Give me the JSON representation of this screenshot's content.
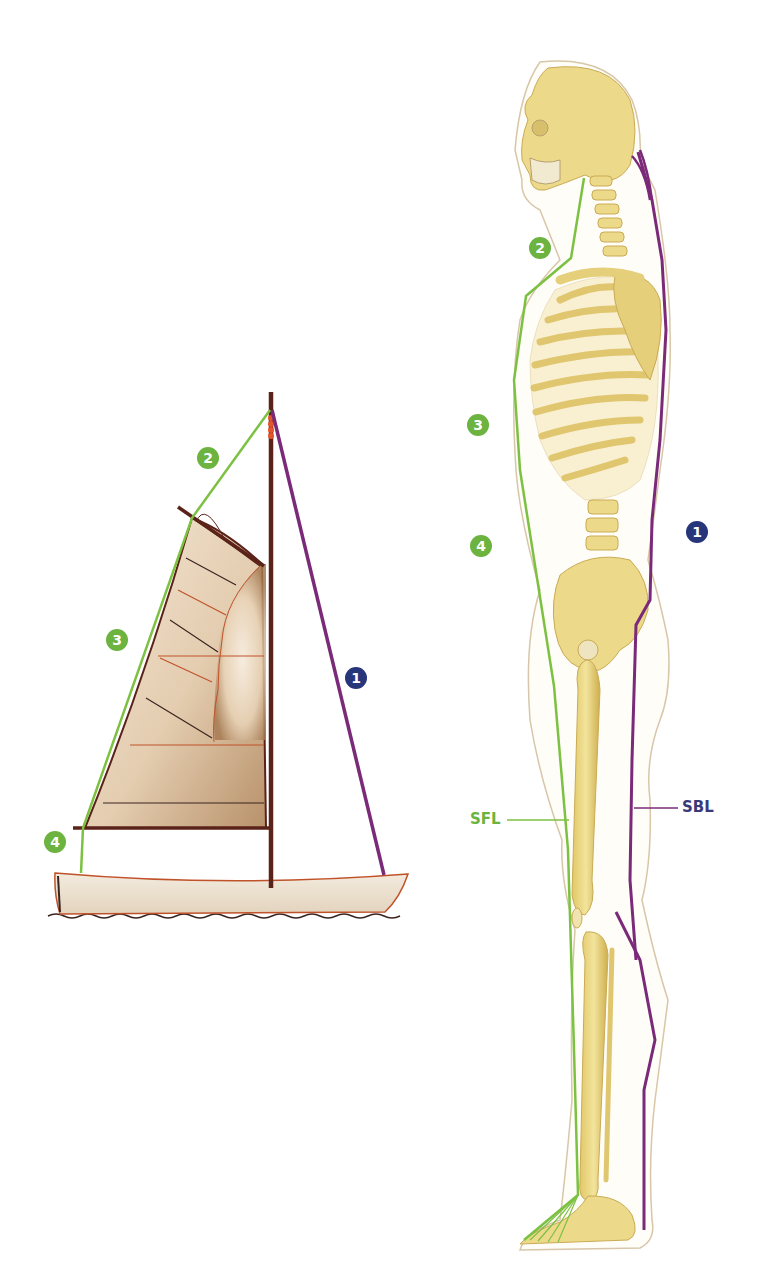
{
  "diagram": {
    "colors": {
      "sfl_green": "#7cc142",
      "sbl_purple": "#7a2a78",
      "badge_green": "#6cb33f",
      "badge_navy": "#27357a",
      "sfl_label": "#6cb33f",
      "sbl_label": "#3a3a7a",
      "mast_brown": "#5a2218",
      "bone_yellow": "#ecd98a",
      "sail_tan": "#ead9c3",
      "hull_tan": "#efe4d4",
      "hull_outline": "#c0522a"
    },
    "sailboat": {
      "badges": [
        {
          "id": "1",
          "label": "1",
          "color": "navy",
          "x": 356,
          "y": 678
        },
        {
          "id": "2",
          "label": "2",
          "color": "green",
          "x": 208,
          "y": 458
        },
        {
          "id": "3",
          "label": "3",
          "color": "green",
          "x": 117,
          "y": 640
        },
        {
          "id": "4",
          "label": "4",
          "color": "green",
          "x": 55,
          "y": 842
        }
      ]
    },
    "skeleton": {
      "badges": [
        {
          "id": "1",
          "label": "1",
          "color": "navy",
          "x": 697,
          "y": 532
        },
        {
          "id": "2",
          "label": "2",
          "color": "green",
          "x": 540,
          "y": 248
        },
        {
          "id": "3",
          "label": "3",
          "color": "green",
          "x": 478,
          "y": 425
        },
        {
          "id": "4",
          "label": "4",
          "color": "green",
          "x": 481,
          "y": 546
        }
      ],
      "labels": {
        "sfl": "SFL",
        "sbl": "SBL"
      }
    }
  }
}
